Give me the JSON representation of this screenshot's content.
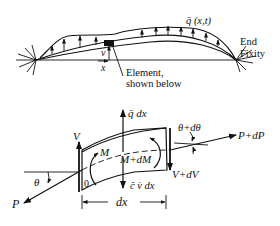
{
  "top_figure": {
    "load_label": "q̄ (x,t)",
    "fixity_label_line1": "End",
    "fixity_label_line2": "Fixity",
    "element_label_line1": "Element,",
    "element_label_line2": "shown below",
    "v_label": "v",
    "x_label": "x"
  },
  "element_figure": {
    "q_label": "q̄ dx",
    "V_label": "V",
    "M_label": "M",
    "MdM_label": "M+dM",
    "VdV_label": "V+dV",
    "theta_label": "θ",
    "theta_d_label": "θ+dθ",
    "P_label": "P",
    "PdP_label": "P+dP",
    "origin_label": "0",
    "inertia_label": "c̄ v̇ dx",
    "dx_label": "dx"
  },
  "colors": {
    "ink": "#111111",
    "background": "#ffffff"
  }
}
